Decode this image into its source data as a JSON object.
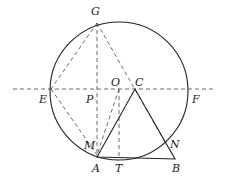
{
  "diagram": {
    "type": "geometry",
    "circle": {
      "cx": 119,
      "cy": 91,
      "r": 69
    },
    "points": {
      "G": {
        "x": 97,
        "y": 23,
        "label": "G",
        "lx": 91,
        "ly": 15
      },
      "E": {
        "x": 51,
        "y": 89,
        "label": "E",
        "lx": 39,
        "ly": 103
      },
      "P": {
        "x": 97,
        "y": 89,
        "label": "P",
        "lx": 86,
        "ly": 103
      },
      "O": {
        "x": 119,
        "y": 89,
        "label": "O",
        "lx": 111,
        "ly": 86
      },
      "C": {
        "x": 135,
        "y": 89,
        "label": "C",
        "lx": 135,
        "ly": 86
      },
      "F": {
        "x": 188,
        "y": 89,
        "label": "F",
        "lx": 192,
        "ly": 103
      },
      "M": {
        "x": 97,
        "y": 155,
        "label": "M",
        "lx": 84,
        "ly": 149
      },
      "N": {
        "x": 165,
        "y": 142,
        "label": "N",
        "lx": 170,
        "ly": 148
      },
      "A": {
        "x": 97,
        "y": 157,
        "label": "A",
        "lx": 92,
        "ly": 172
      },
      "T": {
        "x": 119,
        "y": 159,
        "label": "T",
        "lx": 115,
        "ly": 172
      },
      "B": {
        "x": 175,
        "y": 159,
        "label": "B",
        "lx": 172,
        "ly": 172
      }
    },
    "labels": [
      "G",
      "E",
      "P",
      "O",
      "C",
      "F",
      "M",
      "N",
      "A",
      "T",
      "B"
    ]
  }
}
